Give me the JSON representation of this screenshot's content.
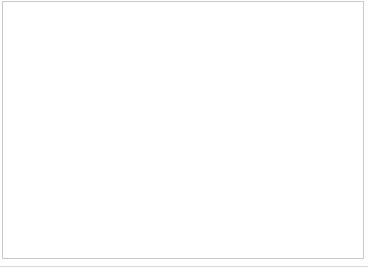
{
  "chart_data": {
    "type": "bar",
    "title": "",
    "subtitle": "",
    "xlabel": "",
    "ylabel": "법인세에서의 최대 세율",
    "y2label": "가처분 소득에서의 소비세 합계",
    "grid": true,
    "legend_position": "top-center",
    "x": [
      1994,
      1995,
      1996,
      1997,
      1998,
      1999,
      2000,
      2001,
      2002,
      2003,
      2004,
      2005,
      2006,
      2007,
      2008,
      2009,
      2010,
      2011,
      2012,
      2013,
      2014,
      2015,
      2016,
      2017,
      2018,
      2019,
      2020
    ],
    "xtick_labels": [
      "1994",
      "1998",
      "2002",
      "2006",
      "2010",
      "2014",
      "2018"
    ],
    "xtick_values": [
      1994,
      1998,
      2002,
      2006,
      2010,
      2014,
      2018
    ],
    "ylim": [
      0,
      60
    ],
    "ytick_labels": [
      "0%",
      "10%",
      "20%",
      "30%",
      "40%",
      "50%",
      "60%"
    ],
    "ytick_values": [
      0,
      10,
      20,
      30,
      40,
      50,
      60
    ],
    "y2lim": [
      0,
      9
    ],
    "y2tick_labels": [
      "0%",
      "1%",
      "2%",
      "3%",
      "4%",
      "5%",
      "6%",
      "7%",
      "8%",
      "9%"
    ],
    "y2tick_values": [
      0,
      1,
      2,
      3,
      4,
      5,
      6,
      7,
      8,
      9
    ],
    "series": [
      {
        "name": "법인세",
        "type": "bar",
        "axis": "left",
        "color": "#9a9a9a",
        "values": [
          52.0,
          51.3,
          51.3,
          51.5,
          51.4,
          48.0,
          41.8,
          41.8,
          41.8,
          41.8,
          41.8,
          40.0,
          40.0,
          40.0,
          40.0,
          40.0,
          40.0,
          40.0,
          37.5,
          37.5,
          35.0,
          33.5,
          30.2,
          30.2,
          30.2,
          30.2,
          30.2
        ]
      },
      {
        "name": "소비세",
        "type": "line",
        "axis": "right",
        "color": "#1a1a1a",
        "values": [
          2.4,
          2.42,
          2.48,
          4.12,
          4.22,
          4.08,
          4.12,
          4.18,
          4.24,
          4.32,
          4.4,
          4.46,
          4.38,
          4.28,
          4.22,
          4.2,
          4.28,
          4.4,
          4.52,
          4.62,
          6.02,
          7.8,
          7.52,
          7.56,
          7.5,
          7.62,
          7.82
        ]
      }
    ]
  },
  "legend": {
    "items": [
      {
        "label": "법인세",
        "marker": "bar",
        "color": "#9a9a9a"
      },
      {
        "label": "소비세",
        "marker": "line",
        "color": "#1a1a1a"
      }
    ]
  },
  "axis_titles": {
    "left": "법인세에서의 최대 세율",
    "left_lines": [
      "법인",
      "세에",
      "서의",
      "최대",
      "세율"
    ],
    "right": "가처분 소득에서의 소비세 합계",
    "right_lines": [
      "가처분",
      "소득에",
      "서의",
      "소비세",
      "합계"
    ]
  }
}
